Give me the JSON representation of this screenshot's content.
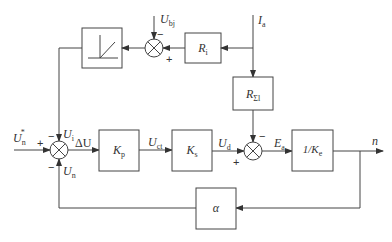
{
  "diagram": {
    "type": "block-diagram",
    "blocks": [
      {
        "id": "limiter",
        "label": "",
        "symbol": "dead-zone-nonlinearity"
      },
      {
        "id": "Ri",
        "label": "R",
        "sub": "i"
      },
      {
        "id": "Rsum",
        "label": "R",
        "sub": "Σl"
      },
      {
        "id": "Kp",
        "label": "K",
        "sub": "p"
      },
      {
        "id": "Ks",
        "label": "K",
        "sub": "s"
      },
      {
        "id": "invKe",
        "label": "1/K",
        "sub": "e"
      },
      {
        "id": "alpha",
        "label": "α"
      }
    ],
    "summing_junctions": [
      {
        "id": "sum_bj",
        "inputs": [
          {
            "signal": "U_bj",
            "sign": "−"
          },
          {
            "signal": "from R_i",
            "sign": "+"
          }
        ]
      },
      {
        "id": "sum_main",
        "inputs": [
          {
            "signal": "U_n*",
            "sign": "+"
          },
          {
            "signal": "U_i",
            "sign": "−"
          },
          {
            "signal": "U_n",
            "sign": "−"
          }
        ]
      },
      {
        "id": "sum_ed",
        "inputs": [
          {
            "signal": "U_d",
            "sign": "+"
          },
          {
            "signal": "from R_Σl",
            "sign": "−"
          }
        ]
      }
    ],
    "signals": {
      "Ubj": {
        "main": "U",
        "sub": "bj"
      },
      "Ia": {
        "main": "I",
        "sub": "a"
      },
      "Un_star": {
        "main": "U",
        "sub": "n",
        "sup": "*"
      },
      "Ui": {
        "main": "U",
        "sub": "i"
      },
      "Un": {
        "main": "U",
        "sub": "n"
      },
      "dU": {
        "main": "ΔU"
      },
      "Uct": {
        "main": "U",
        "sub": "ct"
      },
      "Ud": {
        "main": "U",
        "sub": "d"
      },
      "Ea": {
        "main": "E",
        "sub": "a"
      },
      "n": {
        "main": "n"
      }
    },
    "signs": {
      "minus": "−",
      "plus": "+"
    }
  }
}
